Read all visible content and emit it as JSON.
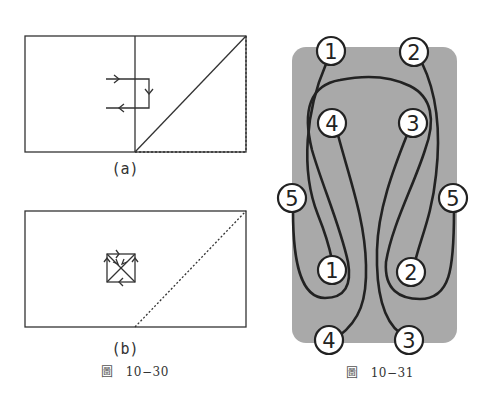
{
  "figure_10_30": {
    "caption_char": "圖",
    "caption_number": "10−30",
    "panel_a": {
      "label": "(a)"
    },
    "panel_b": {
      "label": "(b)"
    }
  },
  "figure_10_31": {
    "caption_char": "圖",
    "caption_number": "10−31",
    "background_color": "#a9a9a9",
    "labels": {
      "top_left": "1",
      "top_right": "2",
      "upper_left": "4",
      "upper_right": "3",
      "side_left": "5",
      "side_right": "5",
      "lower_left": "1",
      "lower_right": "2",
      "bottom_left": "4",
      "bottom_right": "3"
    }
  },
  "colors": {
    "line": "#333333",
    "strand": "#222222",
    "label_fill": "#ffffff"
  }
}
